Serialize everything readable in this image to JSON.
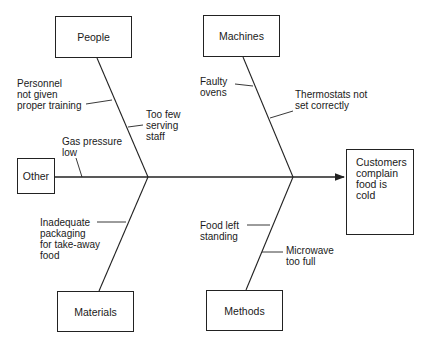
{
  "diagram": {
    "type": "fishbone",
    "effect": {
      "lines": [
        "Customers",
        "complain",
        "food is",
        "cold"
      ]
    },
    "categories": [
      {
        "id": "people",
        "label": "People",
        "causes": [
          {
            "lines": [
              "Personnel",
              "not given",
              "proper training"
            ]
          },
          {
            "lines": [
              "Too few",
              "serving",
              "staff"
            ]
          }
        ]
      },
      {
        "id": "machines",
        "label": "Machines",
        "causes": [
          {
            "lines": [
              "Faulty",
              "ovens"
            ]
          },
          {
            "lines": [
              "Thermostats not",
              "set correctly"
            ]
          }
        ]
      },
      {
        "id": "other",
        "label": "Other",
        "causes": [
          {
            "lines": [
              "Gas pressure",
              "low"
            ]
          }
        ]
      },
      {
        "id": "materials",
        "label": "Materials",
        "causes": [
          {
            "lines": [
              "Inadequate",
              "packaging",
              "for take-away",
              "food"
            ]
          }
        ]
      },
      {
        "id": "methods",
        "label": "Methods",
        "causes": [
          {
            "lines": [
              "Food left",
              "standing"
            ]
          },
          {
            "lines": [
              "Microwave",
              "too full"
            ]
          }
        ]
      }
    ],
    "colors": {
      "line": "#222222",
      "background": "#ffffff",
      "text": "#1a1a1a"
    }
  },
  "text": {
    "effect": "Customers\ncomplain\nfood is\ncold",
    "people": "People",
    "machines": "Machines",
    "other": "Other",
    "materials": "Materials",
    "methods": "Methods",
    "c_personnel": "Personnel\nnot given\nproper training",
    "c_too_few": "Too few\nserving\nstaff",
    "c_faulty": "Faulty\novens",
    "c_thermo": "Thermostats not\nset correctly",
    "c_gas": "Gas pressure\nlow",
    "c_packaging": "Inadequate\npackaging\nfor take-away\nfood",
    "c_food_left": "Food left\nstanding",
    "c_microwave": "Microwave\ntoo full"
  }
}
